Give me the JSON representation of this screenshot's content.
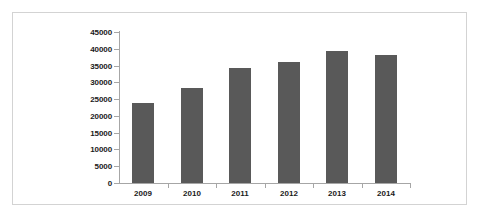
{
  "chart_data": {
    "type": "bar",
    "title": "",
    "subtitle": "",
    "xlabel": "",
    "ylabel": "",
    "categories": [
      "2009",
      "2010",
      "2011",
      "2012",
      "2013",
      "2014"
    ],
    "values": [
      23800,
      28200,
      34400,
      36200,
      39300,
      38200
    ],
    "series": [
      {
        "name": "",
        "values": [
          23800,
          28200,
          34400,
          36200,
          39300,
          38200
        ]
      }
    ],
    "ylim": [
      0,
      45000
    ],
    "ytick_labels": [
      "0",
      "5000",
      "10000",
      "15000",
      "20000",
      "25000",
      "30000",
      "35000",
      "40000",
      "45000"
    ],
    "ytick_values": [
      0,
      5000,
      10000,
      15000,
      20000,
      25000,
      30000,
      35000,
      40000,
      45000
    ],
    "ytick_step": 5000,
    "grid": false,
    "legend": null,
    "legend_position": "none",
    "annotations": [],
    "bar_color": "#595959",
    "axis_color": "#a6a6a6",
    "frame_color": "#d3d3d3",
    "background_color": "#ffffff",
    "tick_label_color": "#1a1a1a"
  }
}
